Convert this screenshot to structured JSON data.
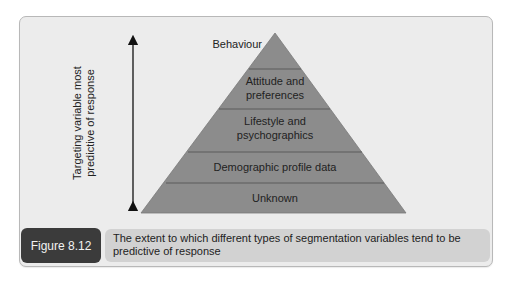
{
  "figure": {
    "number": "Figure 8.12",
    "caption": "The extent to which different types of segmentation variables tend to be predictive of response"
  },
  "axis": {
    "label_line1": "Targeting variable most",
    "label_line2": "predictive of response",
    "direction": "double-headed vertical arrow"
  },
  "pyramid": {
    "fill_color": "#8c8c8c",
    "tiers": [
      {
        "level": 1,
        "label": "Behaviour",
        "position": "apex (label outside, left)"
      },
      {
        "level": 2,
        "label_line1": "Attitude and",
        "label_line2": "preferences"
      },
      {
        "level": 3,
        "label_line1": "Lifestyle and",
        "label_line2": "psychographics"
      },
      {
        "level": 4,
        "label": "Demographic profile data"
      },
      {
        "level": 5,
        "label": "Unknown"
      }
    ]
  },
  "colors": {
    "background": "#ececec",
    "pyramid": "#8c8c8c",
    "figure_label_bg": "#3b3b3b",
    "caption_bg": "#d2d2d2"
  }
}
